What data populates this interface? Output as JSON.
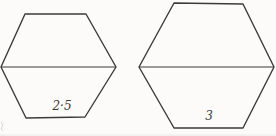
{
  "diagram": {
    "background_color": "#fcfbf9",
    "stroke_color": "#3b3b3b",
    "stroke_width": 1.4,
    "shapes": [
      {
        "name": "left-hexagon",
        "label": "2·5",
        "points": "25,14 86,14 116,67 85,117 26,118 1,67",
        "diagonal": [
          [
            1,
            67
          ],
          [
            116,
            67
          ]
        ],
        "label_pos": [
          62,
          106
        ]
      },
      {
        "name": "right-hexagon",
        "label": "3",
        "points": "174,3 243,4 274,67 243,128 174,128 139,67",
        "diagonal": [
          [
            139,
            67
          ],
          [
            274,
            67
          ]
        ],
        "label_pos": [
          209,
          116
        ]
      }
    ]
  }
}
